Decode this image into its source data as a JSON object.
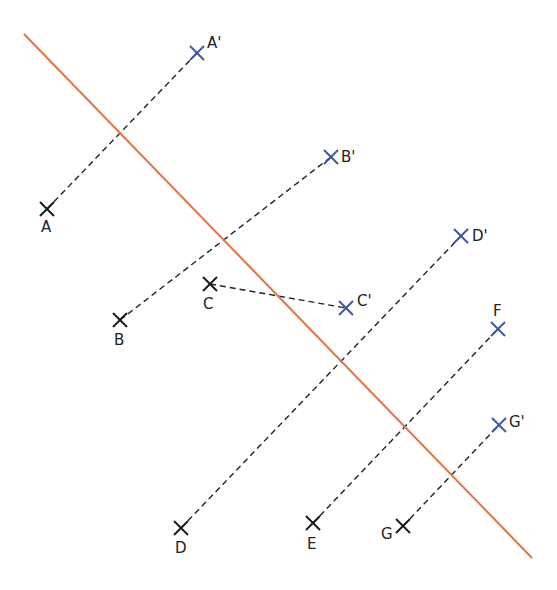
{
  "diagram": {
    "type": "axial-symmetry-construction",
    "axis": {
      "x1": 24,
      "y1": 34,
      "x2": 532,
      "y2": 558,
      "color": "#e8733f"
    },
    "colors": {
      "original": "#1a1a1a",
      "image": "#3a5aa0",
      "segment": "#222222"
    },
    "points": [
      {
        "id": "A",
        "label": "A",
        "x": 47,
        "y": 209,
        "kind": "original",
        "lx": 41,
        "ly": 232
      },
      {
        "id": "A2",
        "label": "A'",
        "x": 197,
        "y": 53,
        "kind": "image",
        "lx": 207,
        "ly": 48
      },
      {
        "id": "B",
        "label": "B",
        "x": 120,
        "y": 320,
        "kind": "original",
        "lx": 114,
        "ly": 345
      },
      {
        "id": "B2",
        "label": "B'",
        "x": 331,
        "y": 157,
        "kind": "image",
        "lx": 341,
        "ly": 162
      },
      {
        "id": "C",
        "label": "C",
        "x": 210,
        "y": 284,
        "kind": "original",
        "lx": 203,
        "ly": 309
      },
      {
        "id": "C2",
        "label": "C'",
        "x": 346,
        "y": 308,
        "kind": "image",
        "lx": 357,
        "ly": 306
      },
      {
        "id": "D",
        "label": "D",
        "x": 181,
        "y": 528,
        "kind": "original",
        "lx": 175,
        "ly": 553
      },
      {
        "id": "D2",
        "label": "D'",
        "x": 461,
        "y": 236,
        "kind": "image",
        "lx": 472,
        "ly": 241
      },
      {
        "id": "E",
        "label": "E",
        "x": 313,
        "y": 523,
        "kind": "original",
        "lx": 307,
        "ly": 549
      },
      {
        "id": "F",
        "label": "F",
        "x": 498,
        "y": 329,
        "kind": "image",
        "lx": 493,
        "ly": 316
      },
      {
        "id": "G",
        "label": "G",
        "x": 403,
        "y": 526,
        "kind": "original",
        "lx": 381,
        "ly": 539
      },
      {
        "id": "G2",
        "label": "G'",
        "x": 499,
        "y": 425,
        "kind": "image",
        "lx": 509,
        "ly": 427
      }
    ],
    "segments": [
      {
        "from": "A",
        "to": "A2"
      },
      {
        "from": "B",
        "to": "B2"
      },
      {
        "from": "C",
        "to": "C2"
      },
      {
        "from": "D",
        "to": "D2"
      },
      {
        "from": "E",
        "to": "F"
      },
      {
        "from": "G",
        "to": "G2"
      }
    ]
  }
}
